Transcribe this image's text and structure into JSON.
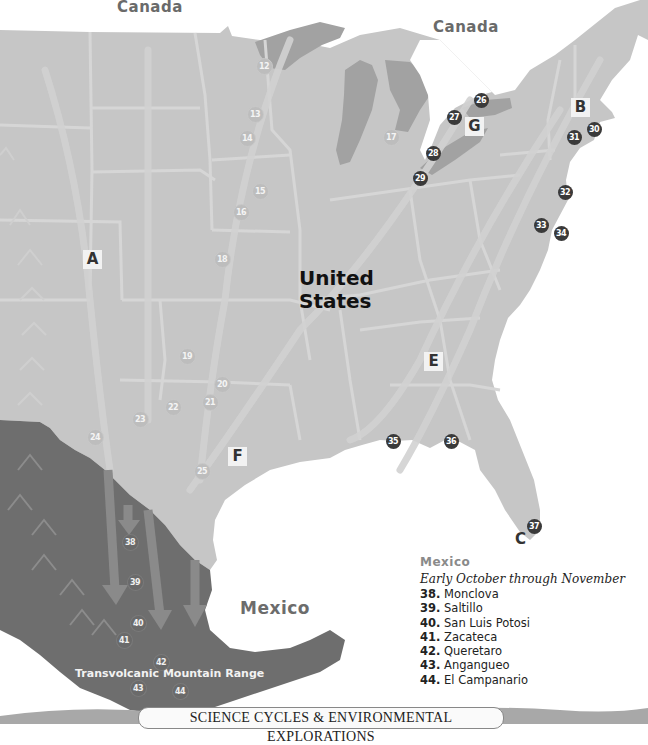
{
  "labels": {
    "canada_west": "Canada",
    "canada_east": "Canada",
    "united_states": "United\nStates",
    "united_states_line1": "United",
    "united_states_line2": "States",
    "mexico": "Mexico",
    "mountain_range": "Transvolcanic Mountain Range"
  },
  "regions": [
    {
      "id": "A",
      "x": 83,
      "y": 250
    },
    {
      "id": "B",
      "x": 571,
      "y": 98
    },
    {
      "id": "C",
      "x": 511,
      "y": 530
    },
    {
      "id": "E",
      "x": 424,
      "y": 352
    },
    {
      "id": "F",
      "x": 228,
      "y": 447
    },
    {
      "id": "G",
      "x": 465,
      "y": 117
    }
  ],
  "markers": [
    {
      "n": "12",
      "x": 264,
      "y": 66,
      "style": "light"
    },
    {
      "n": "13",
      "x": 255,
      "y": 114,
      "style": "light"
    },
    {
      "n": "14",
      "x": 247,
      "y": 138,
      "style": "light"
    },
    {
      "n": "15",
      "x": 260,
      "y": 191,
      "style": "light"
    },
    {
      "n": "16",
      "x": 241,
      "y": 212,
      "style": "light"
    },
    {
      "n": "17",
      "x": 391,
      "y": 137,
      "style": "light"
    },
    {
      "n": "18",
      "x": 222,
      "y": 259,
      "style": "light"
    },
    {
      "n": "19",
      "x": 187,
      "y": 356,
      "style": "light"
    },
    {
      "n": "20",
      "x": 222,
      "y": 384,
      "style": "light"
    },
    {
      "n": "21",
      "x": 210,
      "y": 402,
      "style": "light"
    },
    {
      "n": "22",
      "x": 173,
      "y": 407,
      "style": "light"
    },
    {
      "n": "23",
      "x": 140,
      "y": 419,
      "style": "light"
    },
    {
      "n": "24",
      "x": 95,
      "y": 437,
      "style": "light"
    },
    {
      "n": "25",
      "x": 202,
      "y": 471,
      "style": "light"
    },
    {
      "n": "26",
      "x": 481,
      "y": 100,
      "style": "dark"
    },
    {
      "n": "27",
      "x": 454,
      "y": 117,
      "style": "dark"
    },
    {
      "n": "28",
      "x": 433,
      "y": 153,
      "style": "dark"
    },
    {
      "n": "29",
      "x": 420,
      "y": 178,
      "style": "dark"
    },
    {
      "n": "30",
      "x": 594,
      "y": 129,
      "style": "dark"
    },
    {
      "n": "31",
      "x": 574,
      "y": 137,
      "style": "dark"
    },
    {
      "n": "32",
      "x": 565,
      "y": 192,
      "style": "dark"
    },
    {
      "n": "33",
      "x": 541,
      "y": 225,
      "style": "dark"
    },
    {
      "n": "34",
      "x": 561,
      "y": 233,
      "style": "dark"
    },
    {
      "n": "35",
      "x": 393,
      "y": 441,
      "style": "dark"
    },
    {
      "n": "36",
      "x": 451,
      "y": 441,
      "style": "dark"
    },
    {
      "n": "37",
      "x": 534,
      "y": 526,
      "style": "dark"
    },
    {
      "n": "38",
      "x": 130,
      "y": 542,
      "style": "mx"
    },
    {
      "n": "39",
      "x": 135,
      "y": 582,
      "style": "mx"
    },
    {
      "n": "40",
      "x": 138,
      "y": 623,
      "style": "mx"
    },
    {
      "n": "41",
      "x": 124,
      "y": 640,
      "style": "mx"
    },
    {
      "n": "42",
      "x": 161,
      "y": 662,
      "style": "mx"
    },
    {
      "n": "43",
      "x": 138,
      "y": 688,
      "style": "mx"
    },
    {
      "n": "44",
      "x": 180,
      "y": 691,
      "style": "mx"
    }
  ],
  "legend": {
    "title": "Mexico",
    "subtitle": "Early October through November",
    "items": [
      {
        "num": "38.",
        "name": "Monclova"
      },
      {
        "num": "39.",
        "name": "Saltillo"
      },
      {
        "num": "40.",
        "name": "San Luis Potosi"
      },
      {
        "num": "41.",
        "name": "Zacateca"
      },
      {
        "num": "42.",
        "name": "Queretaro"
      },
      {
        "num": "43.",
        "name": "Angangueo"
      },
      {
        "num": "44.",
        "name": "El Campanario"
      }
    ]
  },
  "banner": {
    "text": "SCIENCE CYCLES & ENVIRONMENTAL EXPLORATIONS"
  },
  "colors": {
    "us_land": "#c6c6c6",
    "great_lakes": "#a2a2a2",
    "mexico_land": "#6e6e6e",
    "borders": "#d6d6d6",
    "flyway_arrows": "#d2d2d2",
    "mexico_arrows": "#8a8a8a",
    "water": "#ffffff"
  }
}
